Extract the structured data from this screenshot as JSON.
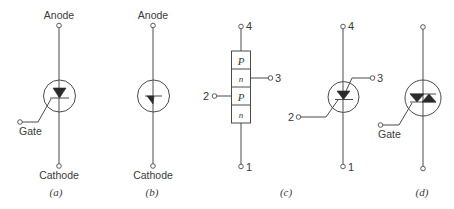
{
  "figure": {
    "panels": [
      {
        "id": "a",
        "caption": "(a)",
        "device": "thyristor-scr-symbol",
        "labels": {
          "top": "Anode",
          "bottom": "Cathode",
          "gate": "Gate"
        }
      },
      {
        "id": "b",
        "caption": "(b)",
        "device": "four-layer-diode-symbol",
        "labels": {
          "top": "Anode",
          "bottom": "Cathode"
        }
      },
      {
        "id": "c",
        "caption": "(c)",
        "device": "pnpn-structure-and-tetrode-thyristor",
        "layers": [
          "P",
          "n",
          "P",
          "n"
        ],
        "structure_terminals": {
          "top": "4",
          "right": "3",
          "left": "2",
          "bottom": "1"
        },
        "symbol_terminals": {
          "top": "4",
          "right": "3",
          "left": "2",
          "bottom": "1"
        }
      },
      {
        "id": "d",
        "caption": "(d)",
        "device": "triac-symbol",
        "labels": {
          "gate": "Gate"
        }
      }
    ]
  }
}
